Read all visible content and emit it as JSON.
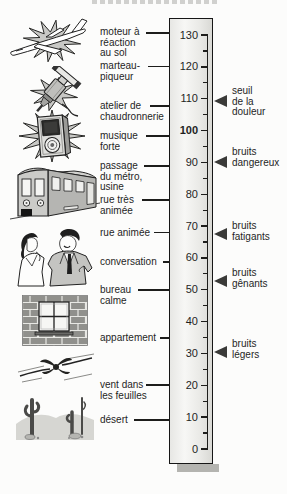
{
  "scale": {
    "min": 0,
    "max": 130,
    "major_step": 10,
    "minor_step": 5,
    "major_labels": [
      "130",
      "120",
      "110",
      "100",
      "90",
      "80",
      "70",
      "60",
      "50",
      "40",
      "30",
      "20",
      "10",
      "0"
    ],
    "bold_label": "100"
  },
  "sources": [
    {
      "label": "moteur à\nréaction\nau sol",
      "level_db": 130,
      "icon": "jet-airplane-icon"
    },
    {
      "label": "marteau-\npiqueur",
      "level_db": 120,
      "icon": "jackhammer-icon"
    },
    {
      "label": "atelier de\nchaudronnerie",
      "level_db": 110,
      "icon": null
    },
    {
      "label": "musique\nforte",
      "level_db": 100,
      "icon": "loudspeaker-icon"
    },
    {
      "label": "passage\ndu métro, usine",
      "level_db": 90,
      "icon": "metro-train-icon"
    },
    {
      "label": "rue très\nanimée",
      "level_db": 80,
      "icon": null
    },
    {
      "label": "rue animée",
      "level_db": 70,
      "icon": "talking-people-icon"
    },
    {
      "label": "conversation",
      "level_db": 60,
      "icon": "talking-people-icon"
    },
    {
      "label": "bureau\ncalme",
      "level_db": 50,
      "icon": "brick-wall-window-icon"
    },
    {
      "label": "appartement",
      "level_db": 40,
      "icon": "brick-wall-window-icon"
    },
    {
      "label": "vent dans\nles feuilles",
      "level_db": 20,
      "icon": "wind-in-leaves-icon"
    },
    {
      "label": "désert",
      "level_db": 10,
      "icon": "desert-icon"
    }
  ],
  "zones": [
    {
      "label": "seuil\nde la\ndouleur",
      "level_db": 110
    },
    {
      "label": "bruits\ndangereux",
      "level_db": 90
    },
    {
      "label": "bruits\nfatigants",
      "level_db": 70
    },
    {
      "label": "bruits\ngênants",
      "level_db": 55
    },
    {
      "label": "bruits\nlégers",
      "level_db": 30
    }
  ],
  "icons": [
    "jet-airplane-icon",
    "jackhammer-icon",
    "loudspeaker-icon",
    "metro-train-icon",
    "talking-people-icon",
    "brick-wall-window-icon",
    "wind-in-leaves-icon",
    "desert-icon"
  ],
  "colors": {
    "ink": "#1f1f1f",
    "column_fill": "#ededea",
    "column_shadow": "#b4b4b0",
    "starburst": "#c8c8c5",
    "arrow": "#3a3a38"
  }
}
